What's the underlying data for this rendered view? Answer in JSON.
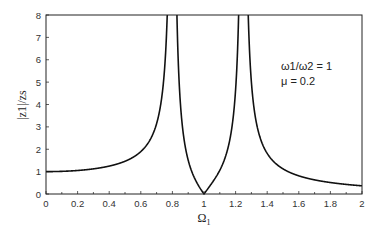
{
  "chart_data": {
    "type": "line",
    "title": "",
    "xlabel": "Ω1",
    "ylabel": "|z1|/zs",
    "xlim": [
      0,
      2
    ],
    "ylim": [
      0,
      8
    ],
    "grid": false,
    "x_ticks": [
      "0",
      "0.2",
      "0.4",
      "0.6",
      "0.8",
      "1",
      "1.2",
      "1.4",
      "1.6",
      "1.8",
      "2"
    ],
    "y_ticks": [
      "0",
      "1",
      "2",
      "3",
      "4",
      "5",
      "6",
      "7",
      "8"
    ],
    "annotations": [
      "ω1/ω2 = 1",
      "μ = 0.2"
    ],
    "parameters": {
      "omega_ratio": 1,
      "mu": 0.2
    },
    "series": [
      {
        "name": "|z1|/zs",
        "color": "#111111",
        "x": [
          0,
          0.2,
          0.4,
          0.5,
          0.6,
          0.7,
          0.75,
          0.78,
          0.8,
          0.8,
          0.85,
          0.9,
          0.95,
          1.0,
          1.05,
          1.1,
          1.15,
          1.2,
          1.23,
          1.23,
          1.25,
          1.3,
          1.4,
          1.5,
          1.6,
          1.8,
          2.0
        ],
        "values": [
          1.0,
          1.05,
          1.22,
          1.4,
          1.75,
          2.6,
          3.8,
          6.0,
          8,
          8,
          4.3,
          2.4,
          1.1,
          0.0,
          1.0,
          2.1,
          3.8,
          7.0,
          8,
          8,
          5.0,
          2.4,
          1.2,
          0.85,
          0.65,
          0.45,
          0.3
        ]
      }
    ]
  },
  "axes": {
    "xlabel_main": "Ω",
    "xlabel_sub": "1",
    "ylabel_text": "|z1|/zs"
  },
  "legend": {
    "line1": "ω1/ω2 = 1",
    "line2": "μ = 0.2"
  }
}
